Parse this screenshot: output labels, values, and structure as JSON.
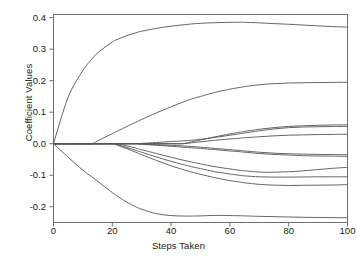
{
  "chart_data": {
    "type": "line",
    "title": "",
    "xlabel": "Steps Taken",
    "ylabel": "Coefficient Values",
    "xlim": [
      0,
      100
    ],
    "ylim": [
      -0.25,
      0.41
    ],
    "xticks": [
      0,
      20,
      40,
      60,
      80,
      100
    ],
    "yticks": [
      0.4,
      0.3,
      0.2,
      0.1,
      0.0,
      -0.1,
      -0.2
    ],
    "xtick_labels": [
      "0",
      "20",
      "40",
      "60",
      "80",
      "100"
    ],
    "ytick_labels": [
      "0.4",
      "0.3",
      "0.2",
      "0.1",
      "0.0",
      "-0.1",
      "-0.2"
    ],
    "grid": false,
    "legend": false,
    "legend_position": "none",
    "line_color": "#555555",
    "frame_color": "#6e6e6e",
    "background": "#ffffff",
    "x": [
      0,
      5,
      10,
      13,
      15,
      20,
      22,
      25,
      28,
      30,
      35,
      40,
      44,
      47,
      50,
      55,
      60,
      63,
      65,
      70,
      75,
      80,
      85,
      90,
      95,
      100
    ],
    "series": [
      {
        "name": "path-1",
        "entry_step": 0,
        "final_value": 0.37,
        "values": [
          0.0,
          0.148,
          0.232,
          0.268,
          0.288,
          0.323,
          0.332,
          0.343,
          0.352,
          0.357,
          0.366,
          0.373,
          0.377,
          0.38,
          0.382,
          0.384,
          0.385,
          0.3855,
          0.385,
          0.3835,
          0.381,
          0.379,
          0.3765,
          0.374,
          0.3715,
          0.37
        ]
      },
      {
        "name": "path-2",
        "entry_step": 13,
        "final_value": 0.195,
        "values": [
          0.0,
          0.0,
          0.0,
          0.0,
          0.009,
          0.032,
          0.041,
          0.055,
          0.068,
          0.077,
          0.098,
          0.117,
          0.132,
          0.142,
          0.15,
          0.163,
          0.173,
          0.178,
          0.181,
          0.187,
          0.1905,
          0.1925,
          0.1935,
          0.194,
          0.1945,
          0.195
        ]
      },
      {
        "name": "path-3",
        "entry_step": 44,
        "final_value": 0.06,
        "values": [
          0.0,
          0.0,
          0.0,
          0.0,
          0.0,
          0.0,
          0.0,
          0.0,
          0.0,
          0.0,
          0.0,
          0.0,
          0.0,
          0.006,
          0.012,
          0.022,
          0.031,
          0.036,
          0.039,
          0.046,
          0.051,
          0.055,
          0.057,
          0.0585,
          0.0595,
          0.06
        ]
      },
      {
        "name": "path-4",
        "entry_step": 28,
        "final_value": 0.055,
        "values": [
          0.0,
          0.0,
          0.0,
          0.0,
          0.0,
          0.0,
          0.0,
          0.0,
          0.0,
          0.001,
          0.004,
          0.007,
          0.009,
          0.011,
          0.014,
          0.02,
          0.027,
          0.031,
          0.034,
          0.041,
          0.047,
          0.051,
          0.053,
          0.054,
          0.0545,
          0.055
        ]
      },
      {
        "name": "path-5",
        "entry_step": 44,
        "final_value": 0.03,
        "values": [
          0.0,
          0.0,
          0.0,
          0.0,
          0.0,
          0.0,
          0.0,
          0.0,
          0.0,
          0.0,
          0.0,
          0.0,
          0.0,
          0.003,
          0.006,
          0.011,
          0.015,
          0.017,
          0.019,
          0.022,
          0.025,
          0.027,
          0.028,
          0.029,
          0.0295,
          0.03
        ]
      },
      {
        "name": "path-6",
        "entry_step": 28,
        "final_value": -0.035,
        "values": [
          0.0,
          0.0,
          0.0,
          0.0,
          0.0,
          0.0,
          0.0,
          0.0,
          0.0,
          -0.001,
          -0.003,
          -0.005,
          -0.007,
          -0.009,
          -0.011,
          -0.015,
          -0.019,
          -0.021,
          -0.023,
          -0.027,
          -0.03,
          -0.032,
          -0.033,
          -0.034,
          -0.0345,
          -0.035
        ]
      },
      {
        "name": "path-7",
        "entry_step": 28,
        "final_value": -0.04,
        "values": [
          0.0,
          0.0,
          0.0,
          0.0,
          0.0,
          0.0,
          0.0,
          0.0,
          0.0,
          -0.002,
          -0.005,
          -0.008,
          -0.011,
          -0.013,
          -0.015,
          -0.019,
          -0.023,
          -0.025,
          -0.027,
          -0.031,
          -0.034,
          -0.036,
          -0.038,
          -0.039,
          -0.0395,
          -0.04
        ]
      },
      {
        "name": "path-8",
        "entry_step": 22,
        "final_value": -0.075,
        "values": [
          0.0,
          0.0,
          0.0,
          0.0,
          0.0,
          0.0,
          -0.001,
          -0.007,
          -0.014,
          -0.019,
          -0.031,
          -0.043,
          -0.052,
          -0.058,
          -0.064,
          -0.073,
          -0.08,
          -0.084,
          -0.086,
          -0.09,
          -0.0905,
          -0.089,
          -0.086,
          -0.082,
          -0.078,
          -0.075
        ]
      },
      {
        "name": "path-9",
        "entry_step": 20,
        "final_value": -0.105,
        "values": [
          0.0,
          0.0,
          0.0,
          0.0,
          0.0,
          0.0,
          -0.004,
          -0.012,
          -0.021,
          -0.027,
          -0.042,
          -0.056,
          -0.066,
          -0.073,
          -0.079,
          -0.089,
          -0.096,
          -0.1,
          -0.102,
          -0.105,
          -0.106,
          -0.106,
          -0.1055,
          -0.105,
          -0.105,
          -0.105
        ]
      },
      {
        "name": "path-10",
        "entry_step": 20,
        "final_value": -0.13,
        "values": [
          0.0,
          0.0,
          0.0,
          0.0,
          0.0,
          0.0,
          -0.006,
          -0.016,
          -0.027,
          -0.035,
          -0.053,
          -0.07,
          -0.082,
          -0.09,
          -0.097,
          -0.108,
          -0.117,
          -0.121,
          -0.124,
          -0.129,
          -0.1315,
          -0.1325,
          -0.132,
          -0.1315,
          -0.131,
          -0.13
        ]
      },
      {
        "name": "path-11",
        "entry_step": 0,
        "final_value": -0.235,
        "values": [
          0.0,
          -0.043,
          -0.084,
          -0.105,
          -0.119,
          -0.155,
          -0.168,
          -0.186,
          -0.2,
          -0.208,
          -0.222,
          -0.228,
          -0.2295,
          -0.2295,
          -0.229,
          -0.2275,
          -0.228,
          -0.2285,
          -0.229,
          -0.2305,
          -0.2315,
          -0.2325,
          -0.2335,
          -0.234,
          -0.2345,
          -0.235
        ]
      }
    ]
  },
  "axes": {
    "ylabel": "Coefficient Values",
    "xlabel": "Steps Taken"
  }
}
